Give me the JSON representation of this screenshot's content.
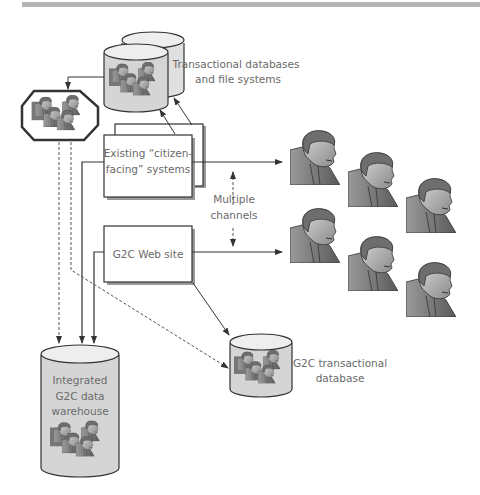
{
  "diagram": {
    "header_bar_color": "#b5b5b5",
    "nodes": {
      "transactional_db": {
        "line1": "Transactional databases",
        "line2": "and file systems"
      },
      "existing_systems": {
        "line1": "Existing “citizen-",
        "line2": "facing” systems"
      },
      "multiple_channels": {
        "line1": "Multiple",
        "line2": "channels"
      },
      "web_site": {
        "label": "G2C Web site"
      },
      "g2c_transactional_db": {
        "line1": "G2C transactional",
        "line2": "database"
      },
      "data_warehouse": {
        "line1": "Integrated",
        "line2": "G2C data",
        "line3": "warehouse"
      }
    },
    "icons": {
      "citizen_group_octagon": "people-group-icon",
      "citizens": "citizen-portrait-icon",
      "database": "database-cylinder-icon"
    }
  }
}
